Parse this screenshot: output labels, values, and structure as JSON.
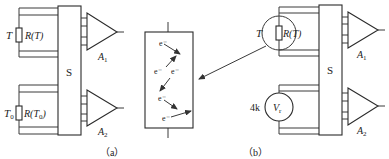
{
  "panels": {
    "a": {
      "caption": "（a）",
      "switch_label": "S",
      "sensor_top": {
        "temp_label": "T",
        "resistor_label": "R(T)"
      },
      "sensor_bottom": {
        "temp_label": "T",
        "temp_sub": "0",
        "resistor_label": "R(T",
        "resistor_sub": "0",
        "resistor_close": ")"
      },
      "amplifiers": [
        {
          "label": "A",
          "sub": "1"
        },
        {
          "label": "A",
          "sub": "2"
        }
      ]
    },
    "center": {
      "description": "magnified resistor showing electron scattering",
      "electrons": [
        "e⁻",
        "e⁻",
        "e⁻",
        "e⁻",
        "e⁻"
      ]
    },
    "b": {
      "caption": "（b）",
      "switch_label": "S",
      "sensor_top": {
        "temp_label": "T",
        "resistor_label": "R(T)"
      },
      "reference": {
        "value_label": "4k",
        "source_label": "V",
        "source_sub": "r"
      },
      "amplifiers": [
        {
          "label": "A",
          "sub": "1"
        },
        {
          "label": "A",
          "sub": "2"
        }
      ]
    }
  }
}
